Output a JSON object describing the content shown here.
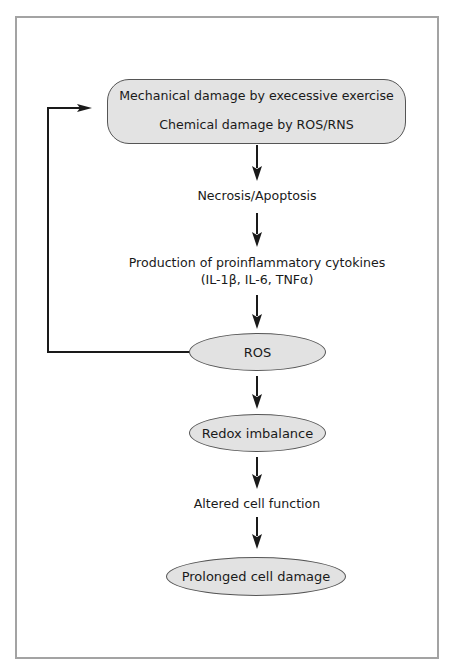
{
  "diagram": {
    "type": "flowchart",
    "nodes": {
      "damage_box": {
        "shape": "rounded-rectangle",
        "line1": "Mechanical damage by execessive exercise",
        "line2": "Chemical damage by ROS/RNS"
      },
      "necrosis": {
        "shape": "text",
        "label": "Necrosis/Apoptosis"
      },
      "production": {
        "shape": "text",
        "line1": "Production of proinflammatory cytokines",
        "line2": "(IL-1β, IL-6, TNFα)"
      },
      "ros": {
        "shape": "ellipse",
        "label": "ROS"
      },
      "redox": {
        "shape": "ellipse",
        "label": "Redox imbalance"
      },
      "altered": {
        "shape": "text",
        "label": "Altered cell function"
      },
      "prolonged": {
        "shape": "ellipse",
        "label": "Prolonged cell damage"
      }
    },
    "edges": [
      {
        "from": "damage_box",
        "to": "necrosis"
      },
      {
        "from": "necrosis",
        "to": "production"
      },
      {
        "from": "production",
        "to": "ros"
      },
      {
        "from": "ros",
        "to": "redox"
      },
      {
        "from": "redox",
        "to": "altered"
      },
      {
        "from": "altered",
        "to": "prolonged"
      },
      {
        "from": "ros",
        "to": "damage_box",
        "kind": "feedback-loop"
      }
    ],
    "colors": {
      "node_fill": "#e2e2e2",
      "node_border": "#555555",
      "arrow": "#1a1a1a",
      "frame_border": "#a3a3a3"
    }
  }
}
